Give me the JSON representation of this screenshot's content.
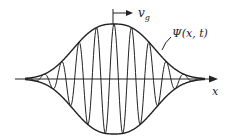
{
  "diagram": {
    "labels": {
      "velocity": "v",
      "velocity_subscript": "g",
      "wavefunction": "Ψ(x, t)",
      "axis": "x"
    },
    "envelope": {
      "center_x": 114,
      "axis_y": 79,
      "amplitude": 55,
      "width_sigma": 38,
      "left_x": 25,
      "right_x": 205
    },
    "carrier": {
      "wavelength": 17.5
    },
    "colors": {
      "stroke": "#222222",
      "background": "#ffffff"
    }
  }
}
